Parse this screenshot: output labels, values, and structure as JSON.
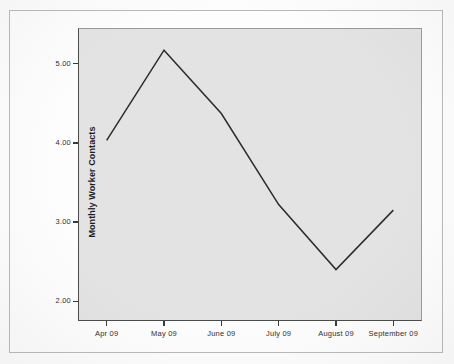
{
  "chart_data": {
    "type": "line",
    "title": "",
    "subtitle": "",
    "xlabel": "",
    "ylabel": "Monthly Worker Contacts",
    "categories": [
      "Apr 09",
      "May 09",
      "June 09",
      "July 09",
      "August 09",
      "September 09"
    ],
    "values": [
      4.03,
      5.17,
      4.37,
      3.22,
      2.4,
      3.15
    ],
    "series": [
      {
        "name": "Monthly Worker Contacts",
        "values": [
          4.03,
          5.17,
          4.37,
          3.22,
          2.4,
          3.15
        ]
      }
    ],
    "ylim": [
      1.75,
      5.45
    ],
    "ytick_labels": [
      "2.00",
      "3.00",
      "4.00",
      "5.00"
    ],
    "ytick_values": [
      2.0,
      3.0,
      4.0,
      5.0
    ],
    "grid": false,
    "legend": false,
    "legend_position": "none",
    "line_color": "#2b2b2b",
    "plot_background": "#e3e3e3",
    "figure_background": "#fdfdfd",
    "markers": false,
    "annotations": []
  },
  "figure": {
    "frame_color": "#b9b9b9",
    "axis_color": "#4a4a4a"
  }
}
